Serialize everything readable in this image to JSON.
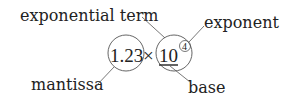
{
  "labels": {
    "exponential_term": "exponential term",
    "exponent": "exponent",
    "mantissa": "mantissa",
    "base": "base"
  },
  "expression": {
    "mantissa": "1.23",
    "times": "×",
    "base": "10",
    "exponent": "4"
  },
  "colors": {
    "stroke": "#555555",
    "text": "#222222"
  }
}
